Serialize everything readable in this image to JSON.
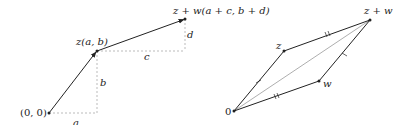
{
  "left_diagram": {
    "labels": {
      "origin": "(0, 0)",
      "z": "z(a, b)",
      "zw": "z + w(a + c, b + d)",
      "a": "a",
      "b": "b",
      "c": "c",
      "d": "d"
    },
    "points": {
      "origin": [
        49,
        113
      ],
      "z": [
        97,
        51
      ],
      "zw": [
        185,
        19
      ]
    }
  },
  "right_diagram": {
    "labels": {
      "zero": "0",
      "z": "z",
      "w": "w",
      "zw": "z + w"
    },
    "points": {
      "zero": [
        234,
        111
      ],
      "z": [
        284,
        51
      ],
      "w": [
        319,
        81
      ],
      "zw": [
        370,
        20
      ]
    }
  },
  "colors": {
    "line": "#222222",
    "dashed": "#aaaaaa",
    "diagonal": "#999999"
  }
}
